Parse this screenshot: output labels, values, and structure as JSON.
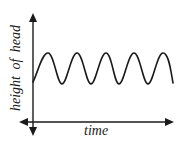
{
  "diagram": {
    "type": "line",
    "x_axis": {
      "label": "time",
      "arrows": [
        "left",
        "right"
      ]
    },
    "y_axis": {
      "label": "height of head",
      "arrows": [
        "up",
        "down"
      ]
    },
    "series": {
      "shape": "sine-like wave",
      "peaks": 5,
      "troughs": 4,
      "stroke_color": "#1a1a1a"
    }
  },
  "colors": {
    "background": "#ffffff",
    "ink": "#1a1a1a"
  }
}
